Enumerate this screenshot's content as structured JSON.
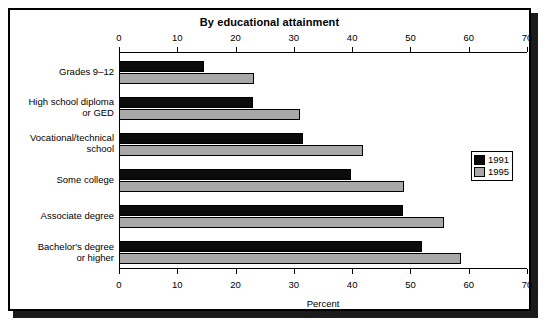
{
  "chart_data": {
    "type": "bar",
    "orientation": "horizontal",
    "title": "By educational attainment",
    "xlabel": "Percent",
    "ylabel": "",
    "xlim": [
      0,
      70
    ],
    "xticks": [
      0,
      10,
      20,
      30,
      40,
      50,
      60,
      70
    ],
    "xtick_labels": [
      "0",
      "10",
      "20",
      "30",
      "40",
      "50",
      "60",
      "70"
    ],
    "grid": false,
    "legend_position": "right",
    "categories": [
      "Grades 9–12",
      "High school diploma\nor GED",
      "Vocational/technical\nschool",
      "Some college",
      "Associate degree",
      "Bachelor's degree\nor higher"
    ],
    "series": [
      {
        "name": "1991",
        "color": "#0b0b0b",
        "values": [
          14.5,
          23.0,
          31.5,
          39.8,
          48.7,
          52.0
        ]
      },
      {
        "name": "1995",
        "color": "#a8a8a8",
        "values": [
          23.2,
          31.0,
          41.8,
          48.9,
          55.8,
          58.7
        ]
      }
    ]
  },
  "legend": {
    "entries": [
      {
        "label": "1991",
        "color": "#0b0b0b"
      },
      {
        "label": "1995",
        "color": "#a8a8a8"
      }
    ]
  },
  "axis": {
    "top_caption": "",
    "bottom_caption": "Percent"
  }
}
